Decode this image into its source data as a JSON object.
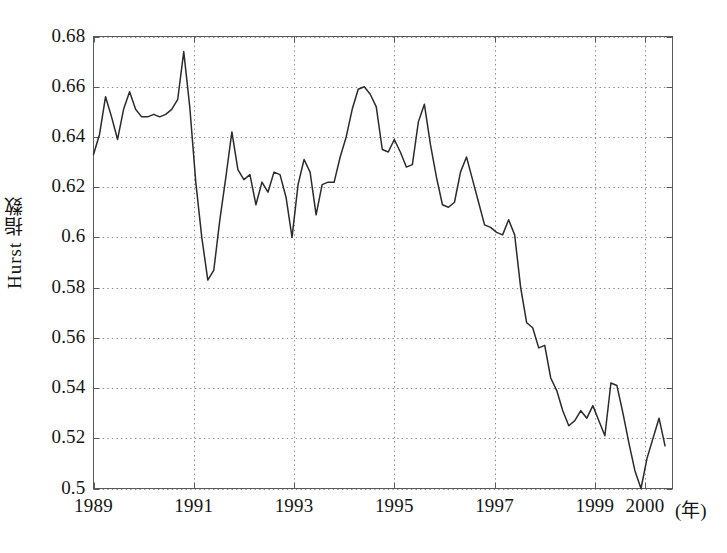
{
  "figure": {
    "background_color": "#ffffff",
    "line_color": "#2b2b2b",
    "grid_color": "#8a8a8a",
    "axis_color": "#5a5a5a",
    "x_axis_unit_label": "(年)",
    "caption_fragment": ""
  },
  "chart_data": {
    "type": "line",
    "title": "",
    "subtitle": "",
    "xlabel": "(年)",
    "ylabel": "Hurst 指数",
    "xlim": [
      1989,
      1989.5
    ],
    "ylim": [
      0.5,
      0.68
    ],
    "grid": true,
    "legend": null,
    "legend_position": "none",
    "x_tick_labels": [
      "1989",
      "1991",
      "1993",
      "1995",
      "1997",
      "1999",
      "2000"
    ],
    "x_tick_values": [
      1989,
      1991,
      1993,
      1995,
      1997,
      1999,
      2000
    ],
    "y_tick_labels": [
      "0.5",
      "0.52",
      "0.54",
      "0.56",
      "0.58",
      "0.6",
      "0.62",
      "0.64",
      "0.66",
      "0.68"
    ],
    "y_tick_values": [
      0.5,
      0.52,
      0.54,
      0.56,
      0.58,
      0.6,
      0.62,
      0.64,
      0.66,
      0.68
    ],
    "series": [
      {
        "name": "Hurst 指数",
        "color": "#2b2b2b",
        "x": [
          1989.0,
          1989.12,
          1989.24,
          1989.36,
          1989.48,
          1989.6,
          1989.72,
          1989.84,
          1989.96,
          1990.08,
          1990.2,
          1990.32,
          1990.44,
          1990.56,
          1990.68,
          1990.8,
          1990.92,
          1991.04,
          1991.16,
          1991.28,
          1991.4,
          1991.52,
          1991.64,
          1991.76,
          1991.88,
          1992.0,
          1992.12,
          1992.24,
          1992.36,
          1992.48,
          1992.6,
          1992.72,
          1992.84,
          1992.96,
          1993.08,
          1993.2,
          1993.32,
          1993.44,
          1993.56,
          1993.68,
          1993.8,
          1993.92,
          1994.04,
          1994.16,
          1994.28,
          1994.4,
          1994.52,
          1994.64,
          1994.76,
          1994.88,
          1995.0,
          1995.12,
          1995.24,
          1995.36,
          1995.48,
          1995.6,
          1995.72,
          1995.84,
          1995.96,
          1996.08,
          1996.2,
          1996.32,
          1996.44,
          1996.56,
          1996.68,
          1996.8,
          1996.92,
          1997.04,
          1997.16,
          1997.28,
          1997.4,
          1997.52,
          1997.64,
          1997.76,
          1997.88,
          1998.0,
          1998.12,
          1998.24,
          1998.36,
          1998.48,
          1998.6,
          1998.72,
          1998.84,
          1998.96,
          1999.08,
          1999.2,
          1999.32,
          1999.44,
          1999.56,
          1999.68,
          1999.8,
          1999.92,
          2000.04,
          2000.16,
          2000.28,
          2000.4
        ],
        "y": [
          0.633,
          0.641,
          0.656,
          0.648,
          0.639,
          0.651,
          0.658,
          0.651,
          0.648,
          0.648,
          0.649,
          0.648,
          0.649,
          0.651,
          0.655,
          0.674,
          0.652,
          0.622,
          0.6,
          0.583,
          0.587,
          0.607,
          0.624,
          0.642,
          0.627,
          0.623,
          0.625,
          0.613,
          0.622,
          0.618,
          0.626,
          0.625,
          0.616,
          0.6,
          0.621,
          0.631,
          0.626,
          0.609,
          0.621,
          0.622,
          0.622,
          0.632,
          0.64,
          0.651,
          0.659,
          0.66,
          0.657,
          0.652,
          0.635,
          0.634,
          0.639,
          0.634,
          0.628,
          0.629,
          0.646,
          0.653,
          0.637,
          0.624,
          0.613,
          0.612,
          0.614,
          0.626,
          0.632,
          0.623,
          0.614,
          0.605,
          0.604,
          0.602,
          0.601,
          0.607,
          0.601,
          0.58,
          0.566,
          0.564,
          0.556,
          0.557,
          0.544,
          0.539,
          0.531,
          0.525,
          0.527,
          0.531,
          0.528,
          0.533,
          0.527,
          0.521,
          0.542,
          0.541,
          0.53,
          0.518,
          0.507,
          0.5,
          0.512,
          0.52,
          0.528,
          0.517
        ]
      }
    ]
  }
}
